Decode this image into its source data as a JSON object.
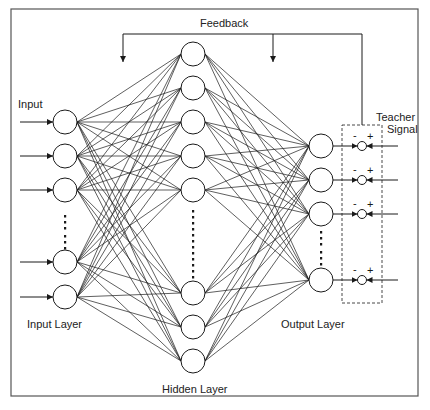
{
  "labels": {
    "feedback": "Feedback",
    "input": "Input",
    "input_layer": "Input Layer",
    "hidden_layer": "Hidden Layer",
    "output_layer": "Output Layer",
    "teacher_signal_line1": "Teacher",
    "teacher_signal_line2": "Signal",
    "minus": "-",
    "plus": "+"
  },
  "colors": {
    "stroke": "#1a1a1a",
    "background": "#ffffff",
    "border": "#555555"
  },
  "network": {
    "node_radius": 12,
    "comparator_radius": 4.5,
    "input_layer": {
      "x": 65,
      "ys": [
        122,
        156,
        190,
        262,
        297
      ],
      "ellipsis_ys": [
        206,
        246
      ]
    },
    "hidden_layer": {
      "x": 193,
      "ys": [
        54,
        88,
        122,
        156,
        190,
        293,
        327,
        361
      ],
      "ellipsis_ys": [
        208,
        280
      ]
    },
    "output_layer": {
      "x": 321,
      "ys": [
        146,
        180,
        214,
        280
      ],
      "ellipsis_ys": [
        230,
        262
      ]
    },
    "comparators": {
      "x": 362,
      "ys": [
        146,
        180,
        214,
        280
      ]
    },
    "teacher_box": {
      "x": 342,
      "y": 125,
      "w": 40,
      "h": 178
    },
    "feedback_line": {
      "y": 34,
      "x_left": 123,
      "x_mid": 273,
      "x_right": 362,
      "arrow_to_y": 62
    },
    "outer_border": {
      "x": 11,
      "y": 9,
      "w": 407,
      "h": 387
    }
  }
}
